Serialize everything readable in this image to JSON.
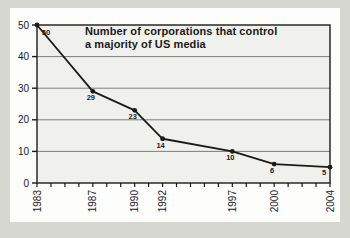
{
  "chart_data": {
    "type": "line",
    "title": "Number of corporations that control a majority of US media",
    "title_lines": [
      "Number of corporations that control",
      "a majority of US media"
    ],
    "x": [
      1983,
      1987,
      1990,
      1992,
      1997,
      2000,
      2004
    ],
    "values": [
      50,
      29,
      23,
      14,
      10,
      6,
      5
    ],
    "point_labels": [
      "50",
      "29",
      "23",
      "14",
      "10",
      "6",
      "5"
    ],
    "xlabel": "",
    "ylabel": "",
    "xlim": [
      1983,
      2004
    ],
    "ylim": [
      0,
      50
    ],
    "y_ticks": [
      0,
      10,
      20,
      30,
      40,
      50
    ],
    "x_minor_tick_step": 1,
    "grid": "horizontal-major",
    "legend": "none",
    "colors": {
      "page_bg": "#d7d7d1",
      "card_bg": "#fdfdfb",
      "plot_bg": "#f0f0ed",
      "grid": "#7d7d7d",
      "line": "#1b1b1b",
      "text": "#1b1b1b"
    }
  }
}
